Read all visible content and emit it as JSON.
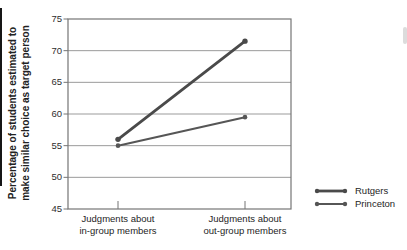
{
  "chart_data": {
    "type": "line",
    "title": "",
    "ylabel_lines": [
      "Percentage of students estimated to",
      "make similar choice as target person"
    ],
    "ylabel": "Percentage of students estimated to make similar choice as target person",
    "xlabel": "",
    "ylim": [
      45,
      75
    ],
    "yticks": [
      45,
      50,
      55,
      60,
      65,
      70,
      75
    ],
    "grid": "horizontal",
    "legend_position": "bottom-right-outside",
    "categories": [
      {
        "lines": [
          "Judgments about",
          "in-group members"
        ]
      },
      {
        "lines": [
          "Judgments about",
          "out-group members"
        ]
      }
    ],
    "series": [
      {
        "name": "Rutgers",
        "values": [
          56,
          71.5
        ],
        "color": "#4a4a4a",
        "line_width": 2.8,
        "marker_radius": 2.7
      },
      {
        "name": "Princeton",
        "values": [
          55,
          59.5
        ],
        "color": "#565656",
        "line_width": 2.0,
        "marker_radius": 2.3
      }
    ],
    "colors": {
      "grid": "#9b9b9b",
      "border": "#757575",
      "text": "#252525"
    }
  }
}
